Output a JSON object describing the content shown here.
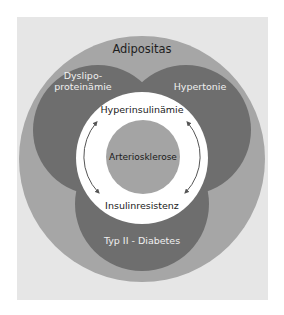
{
  "diagram": {
    "type": "nested-circle-risk-diagram",
    "colors": {
      "panel_bg": "#e6e6e6",
      "outer_circle": "#a6a6a6",
      "risk_circles": "#6e6e6e",
      "ring": "#ffffff",
      "core_circle": "#a4a4a4",
      "arrows": "#555555"
    },
    "outer": {
      "label": "Adipositas"
    },
    "risk_factors": [
      {
        "id": "dyslipo",
        "label": "Dyslipo-proteinämie",
        "position": "upper-left"
      },
      {
        "id": "hypertonie",
        "label": "Hypertonie",
        "position": "upper-right"
      },
      {
        "id": "diabetes",
        "label": "Typ II - Diabetes",
        "position": "bottom"
      }
    ],
    "ring": {
      "top_label": "Hyperinsulinämie",
      "bottom_label": "Insulinresistenz",
      "arrows": [
        {
          "side": "left",
          "direction": "bidirectional"
        },
        {
          "side": "right",
          "direction": "bidirectional"
        }
      ]
    },
    "core": {
      "label": "Arteriosklerose"
    }
  }
}
